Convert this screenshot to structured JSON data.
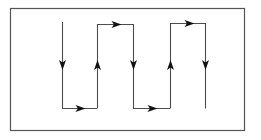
{
  "figure": {
    "background_color": "#ffffff",
    "line_color": "#4d4d4d",
    "arrow_color": "#111111",
    "border": {
      "name": "figure-frame",
      "x": 10,
      "y": 8,
      "width": 234,
      "height": 122,
      "stroke_width": 1.2,
      "color": "#555555",
      "fill": "#ffffff"
    },
    "path_geometry": {
      "column_x": [
        62,
        97,
        133,
        170,
        205
      ],
      "top_y": 24,
      "bottom_y": 108,
      "first_column_top_y": 22,
      "arrow_row_y": 66,
      "stroke_width": 1.1
    },
    "segments": [
      {
        "name": "segment-v1",
        "orientation": "vertical",
        "x": 62,
        "y1": 22,
        "y2": 108,
        "direction": "down",
        "arrow_at": 66
      },
      {
        "name": "segment-h1-bottom",
        "orientation": "horizontal",
        "y": 108,
        "x1": 62,
        "x2": 97,
        "direction": "right",
        "arrow_at": 80
      },
      {
        "name": "segment-v2",
        "orientation": "vertical",
        "x": 97,
        "y1": 108,
        "y2": 24,
        "direction": "up",
        "arrow_at": 66
      },
      {
        "name": "segment-h2-top",
        "orientation": "horizontal",
        "y": 24,
        "x1": 97,
        "x2": 133,
        "direction": "right",
        "arrow_at": 116
      },
      {
        "name": "segment-v3",
        "orientation": "vertical",
        "x": 133,
        "y1": 24,
        "y2": 108,
        "direction": "down",
        "arrow_at": 66
      },
      {
        "name": "segment-h3-bottom",
        "orientation": "horizontal",
        "y": 108,
        "x1": 133,
        "x2": 170,
        "direction": "right",
        "arrow_at": 152
      },
      {
        "name": "segment-v4",
        "orientation": "vertical",
        "x": 170,
        "y1": 108,
        "y2": 23,
        "direction": "up",
        "arrow_at": 66
      },
      {
        "name": "segment-h4-top",
        "orientation": "horizontal",
        "y": 23,
        "x1": 170,
        "x2": 205,
        "direction": "right",
        "arrow_at": 189
      },
      {
        "name": "segment-v5",
        "orientation": "vertical",
        "x": 205,
        "y1": 23,
        "y2": 108,
        "direction": "down",
        "arrow_at": 66
      }
    ],
    "arrowheads": [
      {
        "name": "arrowhead-down-1",
        "x": 62,
        "y": 66,
        "direction": "down"
      },
      {
        "name": "arrowhead-right-1",
        "x": 80,
        "y": 108,
        "direction": "right"
      },
      {
        "name": "arrowhead-up-1",
        "x": 97,
        "y": 66,
        "direction": "up"
      },
      {
        "name": "arrowhead-right-2",
        "x": 116,
        "y": 24,
        "direction": "right"
      },
      {
        "name": "arrowhead-down-2",
        "x": 133,
        "y": 66,
        "direction": "down"
      },
      {
        "name": "arrowhead-right-3",
        "x": 152,
        "y": 108,
        "direction": "right"
      },
      {
        "name": "arrowhead-up-2",
        "x": 170,
        "y": 66,
        "direction": "up"
      },
      {
        "name": "arrowhead-right-4",
        "x": 189,
        "y": 23,
        "direction": "right"
      },
      {
        "name": "arrowhead-down-3",
        "x": 205,
        "y": 66,
        "direction": "down"
      }
    ],
    "labels": []
  }
}
